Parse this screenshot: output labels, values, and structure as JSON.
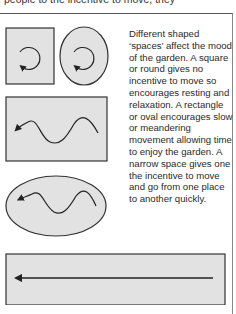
{
  "header": {
    "cropped_text": "people to the incentive to move, they"
  },
  "caption": {
    "text": "Different shaped ‘spaces’ affect the mood of the garden. A square or round gives no incentive to move so encourages resting and relaxation. A rectangle or oval encourages slow or meandering movement allowing time to enjoy the garden. A narrow space gives one the incentive to move and go from one place to another quickly."
  },
  "diagrams": [
    {
      "shape": "square",
      "movement": "circular"
    },
    {
      "shape": "round",
      "movement": "circular"
    },
    {
      "shape": "rectangle",
      "movement": "meandering"
    },
    {
      "shape": "oval",
      "movement": "meandering"
    },
    {
      "shape": "narrow",
      "movement": "straight"
    }
  ],
  "colors": {
    "fill": "#e2e2e2",
    "stroke": "#333333"
  }
}
